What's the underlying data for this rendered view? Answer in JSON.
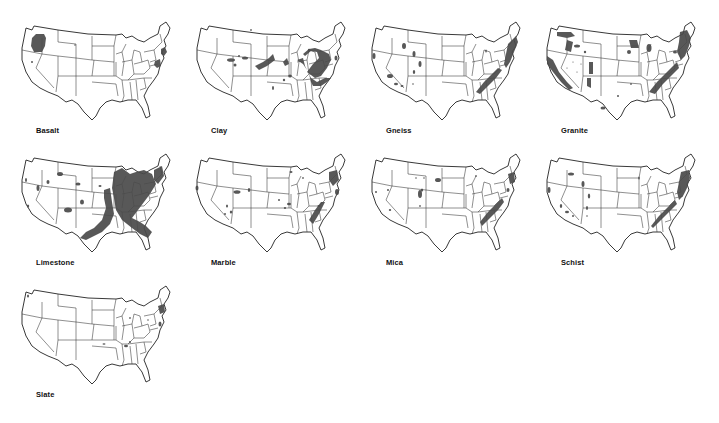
{
  "deposit_color": "#4a4a4a",
  "maps": [
    {
      "name": "Basalt",
      "x": 18,
      "y": 16,
      "blobs": [
        {
          "type": "path",
          "d": "M14 22 L18 18 L26 18 L28 22 L27 30 L24 36 L16 36 L13 30 Z"
        },
        {
          "type": "ellipse",
          "cx": 14,
          "cy": 46,
          "rx": 1,
          "ry": 1
        },
        {
          "type": "ellipse",
          "cx": 57,
          "cy": 29,
          "rx": 0.8,
          "ry": 0.8
        },
        {
          "type": "path",
          "d": "M143 33 L147 31 L149 36 L146 40 L143 38 Z"
        },
        {
          "type": "path",
          "d": "M137 45 L142 43 L143 50 L139 52 L136 49 Z"
        }
      ]
    },
    {
      "name": "Clay",
      "x": 193,
      "y": 16,
      "blobs": [
        {
          "type": "path",
          "d": "M112 40 L118 35 L124 36 L126 42 L120 48 L114 56 L122 62 L128 60 L134 52 L138 44 L136 38 L128 34 L122 32 L116 33 L110 38 Z"
        },
        {
          "type": "path",
          "d": "M104 44 L110 42 L112 50 L116 58 L118 66 L120 70 L128 70 L134 66 L138 62 L132 62 L124 66 L118 62 L114 54 L110 48 Z"
        },
        {
          "type": "path",
          "d": "M62 50 L70 46 L76 42 L80 38 L82 44 L74 50 L66 54 Z"
        },
        {
          "type": "path",
          "d": "M90 46 L94 42 L96 48 L92 50 Z"
        },
        {
          "type": "ellipse",
          "cx": 38,
          "cy": 44,
          "rx": 4,
          "ry": 1.8
        },
        {
          "type": "ellipse",
          "cx": 52,
          "cy": 42,
          "rx": 3,
          "ry": 1.5
        },
        {
          "type": "ellipse",
          "cx": 46,
          "cy": 40,
          "rx": 1,
          "ry": 1
        },
        {
          "type": "ellipse",
          "cx": 42,
          "cy": 49,
          "rx": 1.5,
          "ry": 1.5
        },
        {
          "type": "ellipse",
          "cx": 97,
          "cy": 60,
          "rx": 1.8,
          "ry": 1.5
        },
        {
          "type": "ellipse",
          "cx": 91,
          "cy": 64,
          "rx": 1.2,
          "ry": 1.2
        },
        {
          "type": "ellipse",
          "cx": 80,
          "cy": 72,
          "rx": 1,
          "ry": 2
        },
        {
          "type": "ellipse",
          "cx": 143,
          "cy": 42,
          "rx": 1.5,
          "ry": 2.5
        },
        {
          "type": "ellipse",
          "cx": 58,
          "cy": 14,
          "rx": 0.8,
          "ry": 1
        },
        {
          "type": "ellipse",
          "cx": 116,
          "cy": 34,
          "rx": 1.2,
          "ry": 1.2
        }
      ]
    },
    {
      "name": "Gneiss",
      "x": 368,
      "y": 16,
      "blobs": [
        {
          "type": "path",
          "d": "M140 28 L148 20 L150 26 L146 36 L142 46 L138 52 L136 48 Z"
        },
        {
          "type": "path",
          "d": "M108 76 L116 66 L124 58 L130 52 L134 54 L128 62 L120 70 L112 78 Z"
        },
        {
          "type": "ellipse",
          "cx": 36,
          "cy": 30,
          "rx": 2,
          "ry": 3
        },
        {
          "type": "ellipse",
          "cx": 46,
          "cy": 38,
          "rx": 1.5,
          "ry": 3
        },
        {
          "type": "ellipse",
          "cx": 52,
          "cy": 48,
          "rx": 1.5,
          "ry": 3
        },
        {
          "type": "ellipse",
          "cx": 46,
          "cy": 56,
          "rx": 1.2,
          "ry": 2
        },
        {
          "type": "ellipse",
          "cx": 6,
          "cy": 40,
          "rx": 1.5,
          "ry": 3
        },
        {
          "type": "ellipse",
          "cx": 22,
          "cy": 60,
          "rx": 3,
          "ry": 2
        },
        {
          "type": "ellipse",
          "cx": 28,
          "cy": 68,
          "rx": 2,
          "ry": 1.2
        },
        {
          "type": "ellipse",
          "cx": 34,
          "cy": 70,
          "rx": 1.5,
          "ry": 1
        },
        {
          "type": "ellipse",
          "cx": 118,
          "cy": 35,
          "rx": 0.8,
          "ry": 1.5
        },
        {
          "type": "ellipse",
          "cx": 45,
          "cy": 68,
          "rx": 0.8,
          "ry": 0.8
        }
      ]
    },
    {
      "name": "Granite",
      "x": 543,
      "y": 16,
      "blobs": [
        {
          "type": "path",
          "d": "M137 16 L144 14 L148 22 L146 30 L142 40 L138 44 L134 36 L136 26 Z"
        },
        {
          "type": "path",
          "d": "M106 76 L114 66 L122 58 L130 50 L134 46 L136 52 L128 60 L120 68 L112 78 Z"
        },
        {
          "type": "path",
          "d": "M4 40 L10 44 L16 56 L24 66 L30 72 L26 74 L18 66 L10 56 L4 48 Z"
        },
        {
          "type": "path",
          "d": "M14 16 L28 16 L32 20 L24 22 L14 20 Z"
        },
        {
          "type": "path",
          "d": "M24 24 L30 26 L28 36 L22 34 Z"
        },
        {
          "type": "path",
          "d": "M46 46 L50 46 L50 58 L46 58 Z"
        },
        {
          "type": "path",
          "d": "M44 62 L48 62 L48 72 L44 70 Z"
        },
        {
          "type": "path",
          "d": "M86 24 L94 24 L96 32 L88 32 Z"
        },
        {
          "type": "ellipse",
          "cx": 86,
          "cy": 36,
          "rx": 2,
          "ry": 2
        },
        {
          "type": "ellipse",
          "cx": 106,
          "cy": 32,
          "rx": 2.5,
          "ry": 4
        },
        {
          "type": "ellipse",
          "cx": 132,
          "cy": 36,
          "rx": 2,
          "ry": 1.5
        },
        {
          "type": "ellipse",
          "cx": 34,
          "cy": 30,
          "rx": 3,
          "ry": 1.5
        },
        {
          "type": "ellipse",
          "cx": 42,
          "cy": 36,
          "rx": 1.2,
          "ry": 1.2
        },
        {
          "type": "ellipse",
          "cx": 60,
          "cy": 92,
          "rx": 2.5,
          "ry": 1.5
        },
        {
          "type": "ellipse",
          "cx": 75,
          "cy": 80,
          "rx": 1,
          "ry": 1
        },
        {
          "type": "ellipse",
          "cx": 88,
          "cy": 68,
          "rx": 0.8,
          "ry": 1
        },
        {
          "type": "ellipse",
          "cx": 24,
          "cy": 52,
          "rx": 0.6,
          "ry": 0.6
        },
        {
          "type": "ellipse",
          "cx": 30,
          "cy": 46,
          "rx": 0.6,
          "ry": 0.6
        },
        {
          "type": "ellipse",
          "cx": 34,
          "cy": 56,
          "rx": 0.6,
          "ry": 0.6
        },
        {
          "type": "ellipse",
          "cx": 38,
          "cy": 48,
          "rx": 0.6,
          "ry": 0.6
        }
      ]
    },
    {
      "name": "Limestone",
      "x": 18,
      "y": 148,
      "blobs": [
        {
          "type": "path",
          "d": "M96 24 L104 20 L112 26 L118 24 L126 22 L134 26 L138 36 L132 46 L126 54 L120 62 L114 70 L122 74 L128 78 L134 84 L130 90 L122 86 L114 80 L104 72 L98 62 L96 50 L94 40 Z"
        },
        {
          "type": "path",
          "d": "M86 42 L92 40 L94 54 L96 66 L92 76 L84 84 L76 88 L68 92 L62 90 L68 84 L76 80 L84 72 L88 60 L86 50 Z"
        },
        {
          "type": "path",
          "d": "M136 22 L144 18 L146 28 L140 36 L136 32 Z"
        },
        {
          "type": "ellipse",
          "cx": 50,
          "cy": 62,
          "rx": 4,
          "ry": 2.5
        },
        {
          "type": "ellipse",
          "cx": 64,
          "cy": 54,
          "rx": 2,
          "ry": 2.5
        },
        {
          "type": "ellipse",
          "cx": 60,
          "cy": 36,
          "rx": 2.5,
          "ry": 1.5
        },
        {
          "type": "ellipse",
          "cx": 42,
          "cy": 26,
          "rx": 3,
          "ry": 2
        },
        {
          "type": "ellipse",
          "cx": 20,
          "cy": 40,
          "rx": 1.5,
          "ry": 3
        },
        {
          "type": "ellipse",
          "cx": 30,
          "cy": 34,
          "rx": 1.5,
          "ry": 2
        },
        {
          "type": "ellipse",
          "cx": 8,
          "cy": 32,
          "rx": 1,
          "ry": 2
        },
        {
          "type": "ellipse",
          "cx": 10,
          "cy": 58,
          "rx": 1.2,
          "ry": 1.5
        },
        {
          "type": "ellipse",
          "cx": 82,
          "cy": 38,
          "rx": 1.5,
          "ry": 1
        }
      ]
    },
    {
      "name": "Marble",
      "x": 193,
      "y": 148,
      "blobs": [
        {
          "type": "path",
          "d": "M136 24 L144 22 L146 32 L140 38 L136 32 Z"
        },
        {
          "type": "path",
          "d": "M116 72 L122 62 L128 54 L132 54 L126 66 L120 76 Z"
        },
        {
          "type": "ellipse",
          "cx": 144,
          "cy": 44,
          "rx": 2,
          "ry": 3
        },
        {
          "type": "ellipse",
          "cx": 44,
          "cy": 44,
          "rx": 3.5,
          "ry": 1.8
        },
        {
          "type": "ellipse",
          "cx": 56,
          "cy": 42,
          "rx": 1.2,
          "ry": 2
        },
        {
          "type": "ellipse",
          "cx": 34,
          "cy": 58,
          "rx": 1,
          "ry": 1.5
        },
        {
          "type": "ellipse",
          "cx": 38,
          "cy": 64,
          "rx": 1.2,
          "ry": 1.5
        },
        {
          "type": "ellipse",
          "cx": 32,
          "cy": 66,
          "rx": 1,
          "ry": 1
        },
        {
          "type": "ellipse",
          "cx": 4,
          "cy": 40,
          "rx": 1.5,
          "ry": 2.5
        },
        {
          "type": "ellipse",
          "cx": 96,
          "cy": 56,
          "rx": 2,
          "ry": 1.2
        },
        {
          "type": "ellipse",
          "cx": 92,
          "cy": 60,
          "rx": 1.2,
          "ry": 1
        },
        {
          "type": "ellipse",
          "cx": 86,
          "cy": 52,
          "rx": 1,
          "ry": 1
        },
        {
          "type": "ellipse",
          "cx": 98,
          "cy": 24,
          "rx": 1.5,
          "ry": 1
        },
        {
          "type": "ellipse",
          "cx": 110,
          "cy": 30,
          "rx": 0.8,
          "ry": 1
        },
        {
          "type": "ellipse",
          "cx": 126,
          "cy": 58,
          "rx": 1.5,
          "ry": 1
        }
      ]
    },
    {
      "name": "Mica",
      "x": 368,
      "y": 148,
      "blobs": [
        {
          "type": "path",
          "d": "M112 74 L120 64 L128 56 L134 50 L136 54 L130 62 L122 70 L114 78 Z"
        },
        {
          "type": "path",
          "d": "M140 26 L146 24 L147 34 L142 36 Z"
        },
        {
          "type": "ellipse",
          "cx": 140,
          "cy": 42,
          "rx": 1.5,
          "ry": 2
        },
        {
          "type": "ellipse",
          "cx": 52,
          "cy": 46,
          "rx": 2,
          "ry": 4
        },
        {
          "type": "ellipse",
          "cx": 54,
          "cy": 42,
          "rx": 1.2,
          "ry": 1.5
        },
        {
          "type": "ellipse",
          "cx": 70,
          "cy": 32,
          "rx": 3,
          "ry": 2
        },
        {
          "type": "ellipse",
          "cx": 48,
          "cy": 30,
          "rx": 0.8,
          "ry": 0.8
        },
        {
          "type": "ellipse",
          "cx": 56,
          "cy": 30,
          "rx": 0.8,
          "ry": 0.8
        },
        {
          "type": "ellipse",
          "cx": 20,
          "cy": 42,
          "rx": 1,
          "ry": 1
        },
        {
          "type": "ellipse",
          "cx": 8,
          "cy": 44,
          "rx": 1,
          "ry": 1
        },
        {
          "type": "ellipse",
          "cx": 22,
          "cy": 62,
          "rx": 1.2,
          "ry": 1
        },
        {
          "type": "ellipse",
          "cx": 52,
          "cy": 58,
          "rx": 0.8,
          "ry": 1
        },
        {
          "type": "ellipse",
          "cx": 108,
          "cy": 28,
          "rx": 0.8,
          "ry": 1
        }
      ]
    },
    {
      "name": "Schist",
      "x": 543,
      "y": 148,
      "blobs": [
        {
          "type": "path",
          "d": "M138 24 L146 22 L147 30 L144 40 L140 48 L136 52 L134 44 Z"
        },
        {
          "type": "path",
          "d": "M108 78 L116 68 L124 60 L132 52 L134 56 L126 64 L118 72 L110 80 Z"
        },
        {
          "type": "ellipse",
          "cx": 28,
          "cy": 26,
          "rx": 3,
          "ry": 1.5
        },
        {
          "type": "ellipse",
          "cx": 40,
          "cy": 36,
          "rx": 1.5,
          "ry": 3
        },
        {
          "type": "ellipse",
          "cx": 46,
          "cy": 48,
          "rx": 1.2,
          "ry": 2.5
        },
        {
          "type": "ellipse",
          "cx": 44,
          "cy": 60,
          "rx": 1,
          "ry": 2
        },
        {
          "type": "ellipse",
          "cx": 6,
          "cy": 42,
          "rx": 1.5,
          "ry": 3
        },
        {
          "type": "ellipse",
          "cx": 18,
          "cy": 58,
          "rx": 1.2,
          "ry": 2
        },
        {
          "type": "ellipse",
          "cx": 24,
          "cy": 64,
          "rx": 2,
          "ry": 1.2
        },
        {
          "type": "ellipse",
          "cx": 30,
          "cy": 68,
          "rx": 1,
          "ry": 1
        },
        {
          "type": "ellipse",
          "cx": 96,
          "cy": 30,
          "rx": 0.8,
          "ry": 1.5
        },
        {
          "type": "ellipse",
          "cx": 44,
          "cy": 68,
          "rx": 0.8,
          "ry": 0.8
        }
      ]
    },
    {
      "name": "Slate",
      "x": 18,
      "y": 280,
      "blobs": [
        {
          "type": "path",
          "d": "M140 26 L146 24 L147 32 L142 34 Z"
        },
        {
          "type": "ellipse",
          "cx": 142,
          "cy": 44,
          "rx": 1.5,
          "ry": 2.5
        },
        {
          "type": "ellipse",
          "cx": 108,
          "cy": 66,
          "rx": 2,
          "ry": 1.2
        },
        {
          "type": "ellipse",
          "cx": 112,
          "cy": 62,
          "rx": 1,
          "ry": 1
        },
        {
          "type": "ellipse",
          "cx": 86,
          "cy": 64,
          "rx": 1.5,
          "ry": 0.8
        },
        {
          "type": "ellipse",
          "cx": 10,
          "cy": 16,
          "rx": 1,
          "ry": 1.5
        },
        {
          "type": "ellipse",
          "cx": 112,
          "cy": 38,
          "rx": 0.8,
          "ry": 1
        },
        {
          "type": "ellipse",
          "cx": 130,
          "cy": 40,
          "rx": 0.8,
          "ry": 0.8
        }
      ]
    }
  ]
}
